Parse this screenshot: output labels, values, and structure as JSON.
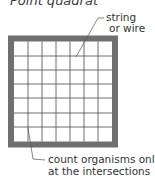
{
  "diagram": {
    "title": "Point quadrat",
    "grid": {
      "rows": 7,
      "cols": 7
    },
    "colors": {
      "frame": "#6f6f6f",
      "grid_line": "#4a4a4a",
      "background": "#ffffff",
      "text": "#333333"
    },
    "labels": {
      "string_line1": "string",
      "string_line2": "or wire",
      "count_line1": "count organisms only",
      "count_line2": "at the intersections"
    }
  }
}
